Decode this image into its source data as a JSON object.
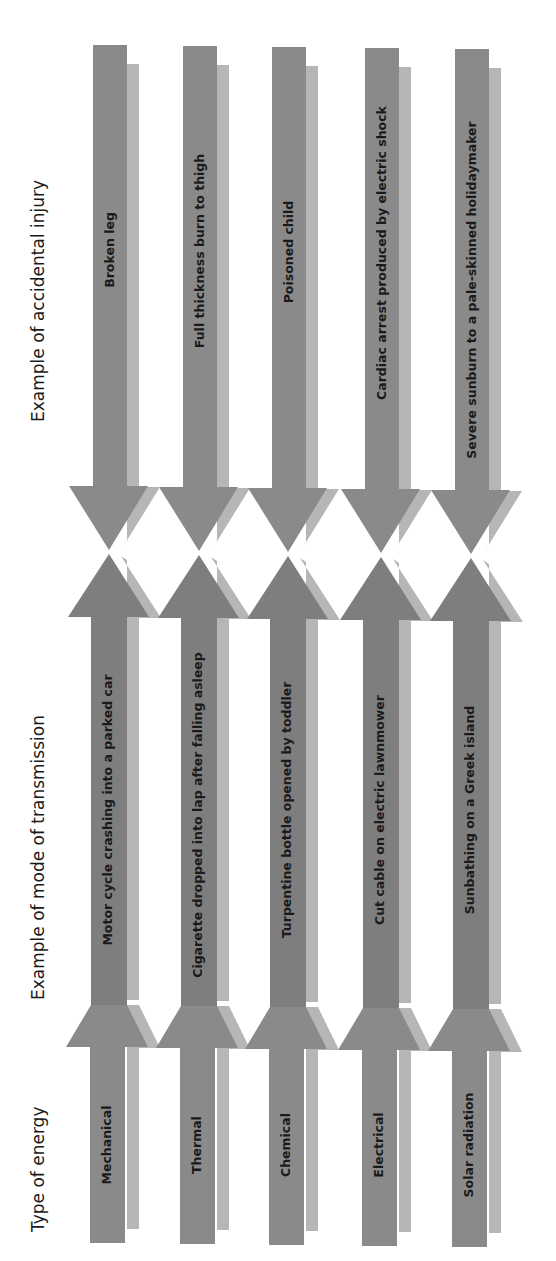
{
  "headings": {
    "injury": "Example of accidental injury",
    "transmission": "Example of mode of transmission",
    "energy": "Type of energy"
  },
  "colors": {
    "dark": "#8a8a8a",
    "mid": "#7e7e7e",
    "light": "#b6b6b6",
    "text": "#1a1a1a"
  },
  "rows": [
    {
      "energy": "Mechanical",
      "transmission": "Motor cycle crashing into a parked car",
      "injury": "Broken leg"
    },
    {
      "energy": "Thermal",
      "transmission": "Cigarette dropped into lap after falling asleep",
      "injury": "Full thickness burn to thigh"
    },
    {
      "energy": "Chemical",
      "transmission": "Turpentine bottle opened by toddler",
      "injury": "Poisoned child"
    },
    {
      "energy": "Electrical",
      "transmission": "Cut cable on electric lawnmower",
      "injury": "Cardiac arrest produced by electric shock"
    },
    {
      "energy": "Solar radiation",
      "transmission": "Sunbathing on a Greek island",
      "injury": "Severe sunburn to a pale-skinned holidaymaker"
    }
  ]
}
